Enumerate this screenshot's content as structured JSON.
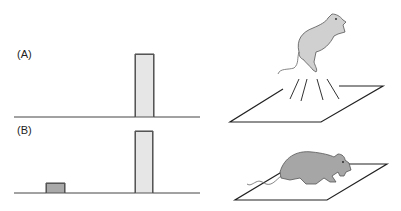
{
  "panels": [
    {
      "label": "(A)",
      "description": "Single loud tone pulse; startle response (jump)"
    },
    {
      "label": "(B)",
      "description": "Weak prepulse followed by loud pulse; reduced startle"
    }
  ],
  "colors": {
    "pulse_fill": "#e6e6e6",
    "prepulse_fill": "#a9a9a9",
    "mouse_a": "#d0d0d0",
    "mouse_b": "#a6a6a6",
    "line": "#333333"
  }
}
